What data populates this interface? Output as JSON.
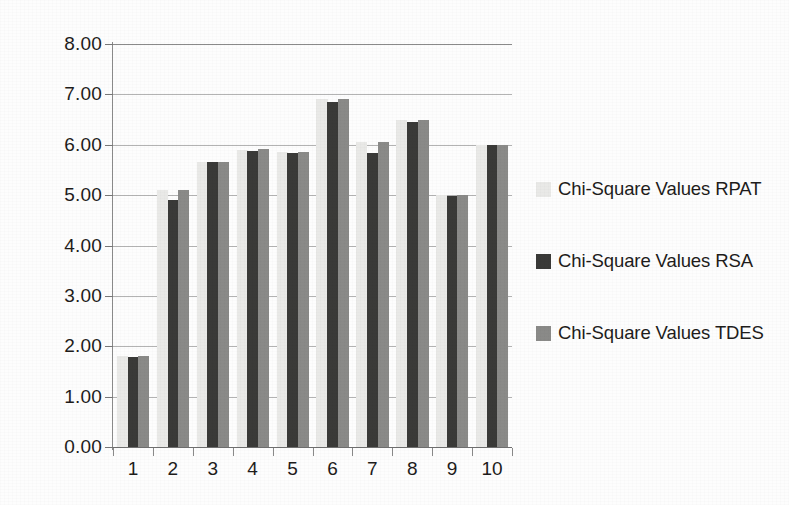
{
  "chart_data": {
    "type": "bar",
    "title": "",
    "subtitle": "",
    "xlabel": "",
    "ylabel": "",
    "categories": [
      "1",
      "2",
      "3",
      "4",
      "5",
      "6",
      "7",
      "8",
      "9",
      "10"
    ],
    "series": [
      {
        "name": "Chi-Square Values RPAT",
        "key": "rpat",
        "color": "#e9e9e7",
        "values": [
          1.8,
          5.1,
          5.65,
          5.9,
          5.85,
          6.9,
          6.05,
          6.5,
          5.0,
          6.0
        ]
      },
      {
        "name": "Chi-Square Values RSA",
        "key": "rsa",
        "color": "#3a3a38",
        "values": [
          1.78,
          4.9,
          5.65,
          5.88,
          5.83,
          6.85,
          5.83,
          6.45,
          4.98,
          6.0
        ]
      },
      {
        "name": "Chi-Square Values TDES",
        "key": "tdes",
        "color": "#8a8a88",
        "values": [
          1.8,
          5.1,
          5.65,
          5.92,
          5.85,
          6.9,
          6.05,
          6.5,
          5.0,
          6.0
        ]
      }
    ],
    "ylim": [
      0,
      8
    ],
    "ytick_values": [
      0,
      1,
      2,
      3,
      4,
      5,
      6,
      7,
      8
    ],
    "ytick_labels": [
      "0.00",
      "1.00",
      "2.00",
      "3.00",
      "4.00",
      "5.00",
      "6.00",
      "7.00",
      "8.00"
    ],
    "xtick_labels": [
      "1",
      "2",
      "3",
      "4",
      "5",
      "6",
      "7",
      "8",
      "9",
      "10"
    ],
    "grid": true,
    "grid_axis": "y",
    "legend_position": "right",
    "legend": [
      "Chi-Square Values RPAT",
      "Chi-Square Values RSA",
      "Chi-Square Values TDES"
    ]
  }
}
